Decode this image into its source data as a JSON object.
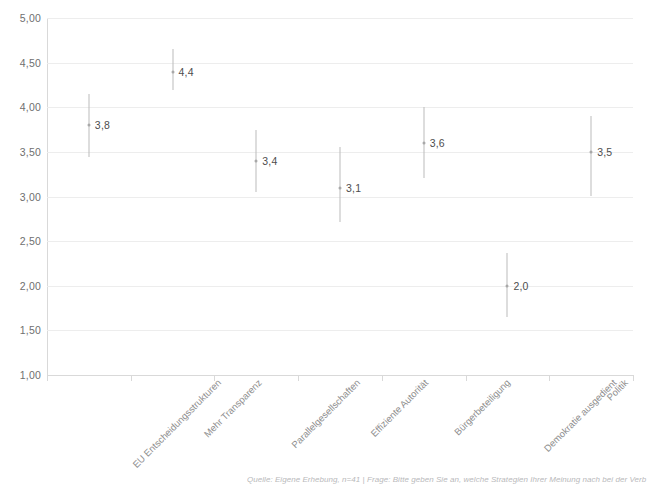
{
  "chart_data": {
    "type": "scatter",
    "title": "",
    "xlabel": "",
    "ylabel": "",
    "ylim": [
      1.0,
      5.0
    ],
    "ytick_step": 0.5,
    "grid": true,
    "legend": "none",
    "locale_decimal_separator": ",",
    "yticks": [
      "1,00",
      "1,50",
      "2,00",
      "2,50",
      "3,00",
      "3,50",
      "4,00",
      "4,50",
      "5,00"
    ],
    "ytick_values": [
      1.0,
      1.5,
      2.0,
      2.5,
      3.0,
      3.5,
      4.0,
      4.5,
      5.0
    ],
    "categories": [
      "EU Entscheidungsstrukturen",
      "Mehr Transparenz",
      "Parallelgesellschaften",
      "Effiziente Autorität",
      "Bürgerbeteiligung",
      "Demokratie ausgedient",
      "Politik"
    ],
    "values": [
      3.8,
      4.4,
      3.4,
      3.1,
      3.6,
      2.0,
      3.5
    ],
    "value_labels": [
      "3,8",
      "4,4",
      "3,4",
      "3,1",
      "3,6",
      "2,0",
      "3,5"
    ],
    "error_low": [
      3.44,
      4.19,
      3.05,
      2.71,
      3.21,
      1.65,
      3.01
    ],
    "error_high": [
      4.15,
      4.65,
      3.74,
      3.55,
      4.0,
      2.37,
      3.9
    ],
    "marker_color": "#a8a8a8",
    "errorbar_color": "#bcbcbc",
    "grid_color": "#ededed",
    "axis_color": "#d9d9d9",
    "label_color": "#4d4d4d"
  },
  "footnote": {
    "text": "Quelle: Eigene Erhebung, n=41 | Frage: Bitte geben Sie an, welche Strategien Ihrer Meinung nach bei der Verb"
  },
  "clipped_title": {
    "text": ""
  }
}
